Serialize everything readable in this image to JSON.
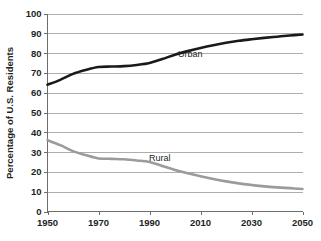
{
  "chart_data": {
    "type": "line",
    "title": "",
    "xlabel": "",
    "ylabel": "Percentage of U.S. Residents",
    "xlim": [
      1950,
      2050
    ],
    "ylim": [
      0,
      100
    ],
    "grid": true,
    "legend_position": "inline-labels",
    "x_ticks": [
      "1950",
      "1970",
      "1990",
      "2010",
      "2030",
      "2050"
    ],
    "x_tick_values": [
      1950,
      1970,
      1990,
      2010,
      2030,
      2050
    ],
    "y_ticks": [
      "0",
      "10",
      "20",
      "30",
      "40",
      "50",
      "60",
      "70",
      "80",
      "90",
      "100"
    ],
    "y_tick_values": [
      0,
      10,
      20,
      30,
      40,
      50,
      60,
      70,
      80,
      90,
      100
    ],
    "x": [
      1950,
      1955,
      1960,
      1965,
      1970,
      1975,
      1980,
      1985,
      1990,
      1995,
      2000,
      2005,
      2010,
      2015,
      2020,
      2025,
      2030,
      2035,
      2040,
      2045,
      2050
    ],
    "series": [
      {
        "name": "Urban",
        "color": "#1a1a1a",
        "label_x": 2006,
        "label_y": 78,
        "values": [
          64,
          66.5,
          69.5,
          71.5,
          73,
          73.2,
          73.4,
          74,
          75,
          77,
          79.2,
          81,
          82.6,
          84,
          85.2,
          86.2,
          87,
          87.7,
          88.3,
          88.9,
          89.4
        ]
      },
      {
        "name": "Rural",
        "color": "#9b9b9b",
        "label_x": 1994,
        "label_y": 25.5,
        "values": [
          36,
          33.5,
          30.5,
          28.5,
          26.8,
          26.6,
          26.4,
          25.8,
          25,
          23,
          21,
          19.3,
          17.8,
          16.4,
          15.2,
          14.2,
          13.4,
          12.7,
          12.2,
          11.8,
          11.4
        ]
      }
    ]
  }
}
